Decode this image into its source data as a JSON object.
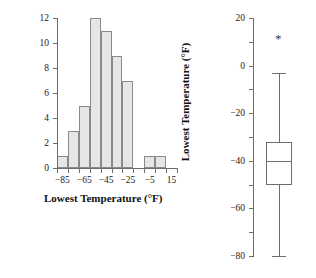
{
  "chart_data": [
    {
      "type": "bar",
      "subtype": "histogram",
      "title": "",
      "xlabel": "Lowest Temperature (°F)",
      "ylabel": "Frequency",
      "xlim": [
        -90,
        20
      ],
      "ylim": [
        0,
        12
      ],
      "grid": false,
      "legend": null,
      "bin_width": 10,
      "bin_edges": [
        -90,
        -80,
        -70,
        -60,
        -50,
        -40,
        -30,
        -20,
        -10,
        0,
        10
      ],
      "categories": [
        "-90 to -80",
        "-80 to -70",
        "-70 to -60",
        "-60 to -50",
        "-50 to -40",
        "-40 to -30",
        "-30 to -20",
        "-20 to -10",
        "-10 to 0",
        "0 to 10"
      ],
      "values": [
        1,
        3,
        5,
        12,
        11,
        9,
        7,
        0,
        1,
        1
      ],
      "xticklabels": [
        "-85",
        "-65",
        "-45",
        "-25",
        "-5",
        "15"
      ],
      "xtickvalues": [
        -85,
        -65,
        -45,
        -25,
        -5,
        15
      ],
      "yticklabels": [
        "0",
        "2",
        "4",
        "6",
        "8",
        "10",
        "12"
      ],
      "ytickvalues": [
        0,
        2,
        4,
        6,
        8,
        10,
        12
      ],
      "bar_fill": "#e6e6e6",
      "bar_edge": "#8a8a8a"
    },
    {
      "type": "box",
      "title": "",
      "xlabel": "",
      "ylabel": "Lowest Temperature (°F)",
      "ylim": [
        -80,
        20
      ],
      "grid": false,
      "legend": null,
      "yticklabels": [
        "20",
        "0",
        "-20",
        "-40",
        "-60",
        "-80"
      ],
      "ytickvalues": [
        20,
        0,
        -20,
        -40,
        -60,
        -80
      ],
      "box": {
        "whisker_low": -80,
        "q1": -50,
        "median": -40,
        "q3": -32,
        "whisker_high": -3,
        "outliers": [
          12
        ]
      },
      "outlier_marker": "*",
      "line_color": "#6d6d6d"
    }
  ],
  "histogram": {
    "xlabel": "Lowest Temperature (°F)",
    "ylabel": "Frequency",
    "xticks": [
      "-85",
      "-65",
      "-45",
      "-25",
      "-5",
      "15"
    ],
    "yticks": [
      "12",
      "10",
      "8",
      "6",
      "4",
      "2",
      "0"
    ]
  },
  "boxplot": {
    "ylabel": "Lowest Temperature (°F)",
    "yticks": [
      "20",
      "0",
      "-20",
      "-40",
      "-60",
      "-80"
    ],
    "outlier_marker": "*"
  }
}
